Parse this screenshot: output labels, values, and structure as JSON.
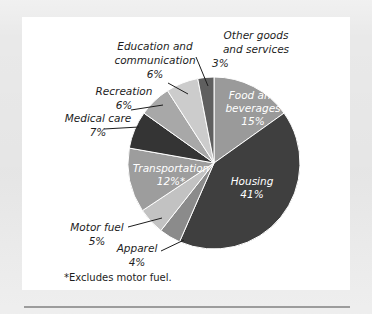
{
  "chart_data": {
    "type": "pie",
    "title": "",
    "subtitle": "",
    "xlabel": "",
    "ylabel": "",
    "legend_position": "none",
    "grid": false,
    "unit": "%",
    "total": 99,
    "footnote": "*Excludes motor fuel.",
    "categories": [
      "Food and beverages",
      "Housing",
      "Apparel",
      "Motor fuel",
      "Transportation",
      "Medical care",
      "Recreation",
      "Education and communication",
      "Other goods and services"
    ],
    "values": [
      15,
      41,
      4,
      5,
      12,
      7,
      6,
      6,
      3
    ],
    "slices": [
      {
        "name": "Food and beverages",
        "label_line1": "Food and",
        "label_line2": "beverages",
        "value_label": "15%",
        "value": 15,
        "color": "#9a9a9a",
        "label_placement": "inside"
      },
      {
        "name": "Housing",
        "label_line1": "Housing",
        "label_line2": "",
        "value_label": "41%",
        "value": 41,
        "color": "#3f3f3f",
        "label_placement": "inside"
      },
      {
        "name": "Apparel",
        "label_line1": "Apparel",
        "label_line2": "",
        "value_label": "4%",
        "value": 4,
        "color": "#8b8b8b",
        "label_placement": "outside"
      },
      {
        "name": "Motor fuel",
        "label_line1": "Motor fuel",
        "label_line2": "",
        "value_label": "5%",
        "value": 5,
        "color": "#c2c2c2",
        "label_placement": "outside"
      },
      {
        "name": "Transportation",
        "label_line1": "Transportation",
        "label_line2": "",
        "value_label": "12%*",
        "value": 12,
        "color": "#9d9d9d",
        "label_placement": "inside"
      },
      {
        "name": "Medical care",
        "label_line1": "Medical care",
        "label_line2": "",
        "value_label": "7%",
        "value": 7,
        "color": "#343434",
        "label_placement": "outside"
      },
      {
        "name": "Recreation",
        "label_line1": "Recreation",
        "label_line2": "",
        "value_label": "6%",
        "value": 6,
        "color": "#a8a8a8",
        "label_placement": "outside"
      },
      {
        "name": "Education and communication",
        "label_line1": "Education and",
        "label_line2": "communication",
        "value_label": "6%",
        "value": 6,
        "color": "#cccccc",
        "label_placement": "outside"
      },
      {
        "name": "Other goods and services",
        "label_line1": "Other goods",
        "label_line2": "and services",
        "value_label": "3%",
        "value": 3,
        "color": "#5f5f5f",
        "label_placement": "outside"
      }
    ],
    "colors": {
      "page_background": "#e9e9e9",
      "panel_background": "#ffffff",
      "text": "#1d1d1d",
      "inside_label_text": "#ffffff",
      "rule": "#9c9c9c"
    },
    "geometry": {
      "center_x": 214,
      "center_y": 163,
      "radius": 86,
      "start_angle_deg": 0
    }
  }
}
